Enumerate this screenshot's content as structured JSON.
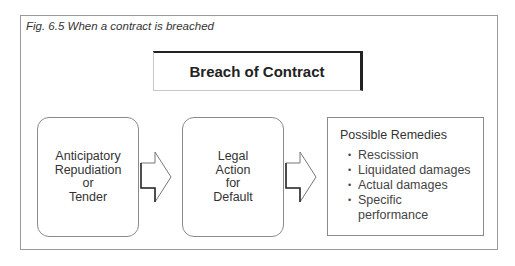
{
  "caption": "Fig. 6.5  When a contract is breached",
  "title": "Breach of Contract",
  "stages": [
    {
      "label": "Anticipatory\nRepudiation\nor\nTender"
    },
    {
      "label": "Legal\nAction\nfor\nDefault"
    }
  ],
  "remedies": {
    "title": "Possible Remedies",
    "bullet": "•",
    "items": [
      {
        "label": "Rescission"
      },
      {
        "label": "Liquidated damages"
      },
      {
        "label": "Actual damages"
      },
      {
        "label": "Specific\nperformance"
      }
    ]
  }
}
